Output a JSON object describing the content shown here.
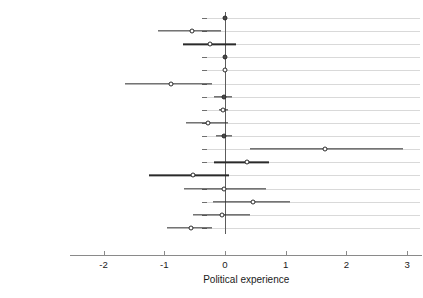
{
  "chart_data": {
    "type": "scatter",
    "title": "",
    "xlabel": "Political experience",
    "ylabel": "",
    "xlim": [
      -2.55,
      3.25
    ],
    "xticks": [
      -2,
      -1,
      0,
      1,
      2,
      3
    ],
    "xticklabels": [
      "-2",
      "-1",
      "0",
      "1",
      "2",
      "3"
    ],
    "grid": true,
    "legend_position": "none",
    "reference_line": 0,
    "categories": [
      "Leader tenure",
      "Leader military",
      "Leader combat",
      "Leader age",
      "Leader age sq",
      "Female leader",
      "Leader education",
      "Total borders",
      "Great power",
      "No of great powers",
      "Democracy",
      "Conflict",
      "Democracy*Conflict",
      "Year",
      "First world war",
      "Second world war",
      "Cold war period"
    ],
    "points": [
      {
        "label": "Leader tenure",
        "estimate": 0.0,
        "low": -0.03,
        "high": 0.03,
        "marker": "filled"
      },
      {
        "label": "Leader military",
        "estimate": -0.55,
        "low": -1.1,
        "high": -0.07,
        "marker": "open"
      },
      {
        "label": "Leader combat",
        "estimate": -0.25,
        "low": -0.7,
        "high": 0.18,
        "marker": "open"
      },
      {
        "label": "Leader age",
        "estimate": 0.0,
        "low": -0.02,
        "high": 0.02,
        "marker": "filled"
      },
      {
        "label": "Leader age sq",
        "estimate": 0.0,
        "low": -0.01,
        "high": 0.01,
        "marker": "open"
      },
      {
        "label": "Female leader",
        "estimate": -0.89,
        "low": -1.64,
        "high": -0.21,
        "marker": "open"
      },
      {
        "label": "Leader education",
        "estimate": -0.02,
        "low": -0.18,
        "high": 0.12,
        "marker": "filled"
      },
      {
        "label": "Total borders",
        "estimate": -0.03,
        "low": -0.1,
        "high": 0.05,
        "marker": "open"
      },
      {
        "label": "Great power",
        "estimate": -0.28,
        "low": -0.64,
        "high": 0.05,
        "marker": "open"
      },
      {
        "label": "No of great powers",
        "estimate": -0.02,
        "low": -0.15,
        "high": 0.12,
        "marker": "filled"
      },
      {
        "label": "Democracy",
        "estimate": 1.64,
        "low": 0.41,
        "high": 2.93,
        "marker": "open"
      },
      {
        "label": "Conflict",
        "estimate": 0.37,
        "low": -0.18,
        "high": 0.73,
        "marker": "open"
      },
      {
        "label": "Democracy*Conflict",
        "estimate": -0.53,
        "low": -1.25,
        "high": 0.07,
        "marker": "open"
      },
      {
        "label": "Year",
        "estimate": -0.01,
        "low": -0.68,
        "high": 0.67,
        "marker": "open"
      },
      {
        "label": "First world war",
        "estimate": 0.46,
        "low": -0.2,
        "high": 1.07,
        "marker": "open"
      },
      {
        "label": "Second world war",
        "estimate": -0.05,
        "low": -0.52,
        "high": 0.42,
        "marker": "open"
      },
      {
        "label": "Cold war period",
        "estimate": -0.56,
        "low": -0.96,
        "high": -0.21,
        "marker": "open"
      }
    ]
  }
}
